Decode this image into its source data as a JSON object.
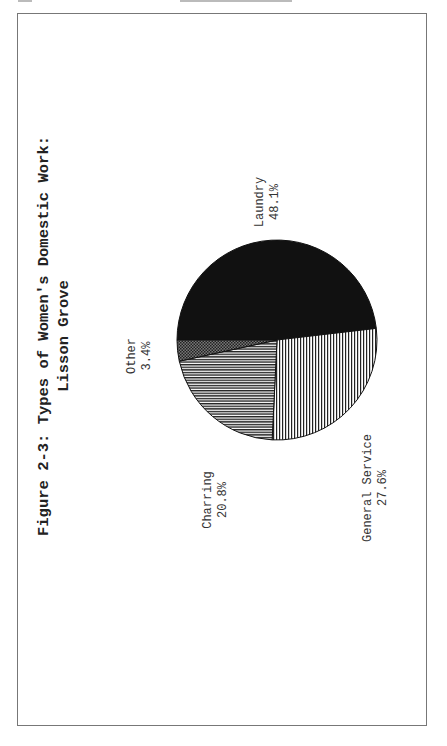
{
  "figure": {
    "title_line1": "Figure 2-3:  Types of Women's Domestic Work:",
    "title_line2": "Lisson Grove"
  },
  "labels": {
    "laundry": {
      "name": "Laundry",
      "value": "48.1%"
    },
    "general_service": {
      "name": "General Service",
      "value": "27.6%"
    },
    "charring": {
      "name": "Charring",
      "value": "20.8%"
    },
    "other": {
      "name": "Other",
      "value": "3.4%"
    }
  },
  "chart_data": {
    "type": "pie",
    "title": "Figure 2-3: Types of Women's Domestic Work: Lisson Grove",
    "categories": [
      "Laundry",
      "General Service",
      "Charring",
      "Other"
    ],
    "values": [
      48.1,
      27.6,
      20.8,
      3.4
    ],
    "unit": "%",
    "fills": {
      "Laundry": "solid black",
      "General Service": "vertical hatch (page-rotated)",
      "Charring": "horizontal hatch (page-rotated)",
      "Other": "crosshatch / stipple"
    },
    "orientation": "page rotated 90 degrees counter-clockwise",
    "legend": "none (direct labels)"
  }
}
